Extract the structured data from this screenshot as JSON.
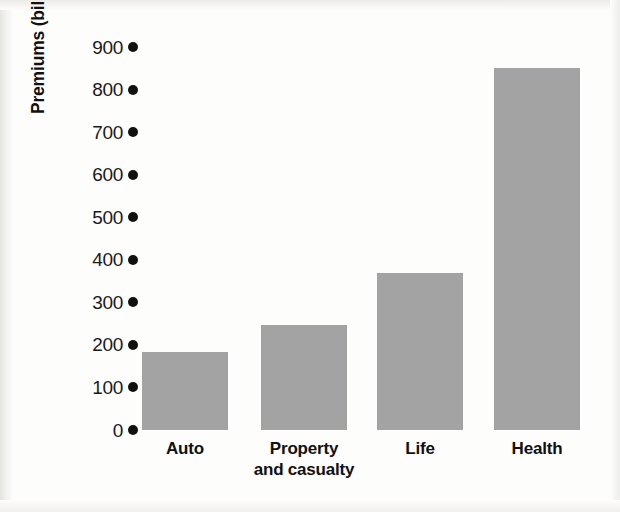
{
  "chart_data": {
    "type": "bar",
    "title": "",
    "xlabel": "",
    "ylabel": "Premiums (billions of dollars per year)",
    "categories": [
      "Auto",
      "Property and casualty",
      "Life",
      "Health"
    ],
    "category_lines": [
      [
        "Auto"
      ],
      [
        "Property",
        "and casualty"
      ],
      [
        "Life"
      ],
      [
        "Health"
      ]
    ],
    "values": [
      183,
      247,
      370,
      850
    ],
    "ylim": [
      0,
      900
    ],
    "yticks": [
      0,
      100,
      200,
      300,
      400,
      500,
      600,
      700,
      800,
      900
    ],
    "ytick_labels": [
      "0",
      "100",
      "200",
      "300",
      "400",
      "500",
      "600",
      "700",
      "800",
      "900"
    ],
    "grid": false,
    "legend": "none",
    "bar_color": "#a3a3a3",
    "axis_marker": "round-dot",
    "background_color": "#fdfdfc"
  }
}
